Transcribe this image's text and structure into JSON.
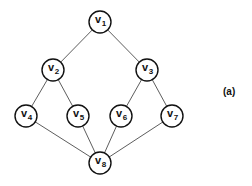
{
  "diagram": {
    "caption": "(a)",
    "nodes": [
      {
        "id": "v1",
        "letter": "v",
        "sub": "1",
        "x": 100,
        "y": 22
      },
      {
        "id": "v2",
        "letter": "v",
        "sub": "2",
        "x": 53,
        "y": 70
      },
      {
        "id": "v3",
        "letter": "v",
        "sub": "3",
        "x": 147,
        "y": 70
      },
      {
        "id": "v4",
        "letter": "v",
        "sub": "4",
        "x": 26,
        "y": 116
      },
      {
        "id": "v5",
        "letter": "v",
        "sub": "5",
        "x": 78,
        "y": 116
      },
      {
        "id": "v6",
        "letter": "v",
        "sub": "6",
        "x": 121,
        "y": 116
      },
      {
        "id": "v7",
        "letter": "v",
        "sub": "7",
        "x": 172,
        "y": 116
      },
      {
        "id": "v8",
        "letter": "v",
        "sub": "8",
        "x": 100,
        "y": 163
      }
    ],
    "edges": [
      [
        "v1",
        "v2"
      ],
      [
        "v1",
        "v3"
      ],
      [
        "v2",
        "v4"
      ],
      [
        "v2",
        "v5"
      ],
      [
        "v3",
        "v6"
      ],
      [
        "v3",
        "v7"
      ],
      [
        "v4",
        "v8"
      ],
      [
        "v5",
        "v8"
      ],
      [
        "v6",
        "v8"
      ],
      [
        "v7",
        "v8"
      ]
    ],
    "node_radius": 11
  }
}
